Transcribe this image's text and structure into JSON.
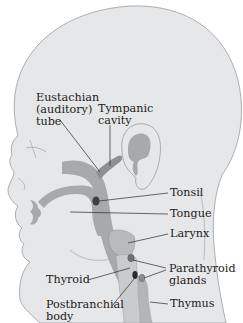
{
  "diagram": {
    "colors": {
      "skin": "#e6e7e8",
      "outline": "#9a9c9e",
      "pharynx": "#a7a9ab",
      "dark_structure": "#4d4d4f",
      "leader_line": "#2a2a2a",
      "text": "#1c1c1c"
    },
    "labels": [
      {
        "id": "eustachian",
        "text": "Eustachian\n(auditory)\ntube"
      },
      {
        "id": "tympanic",
        "text": "Tympanic\ncavity"
      },
      {
        "id": "tonsil",
        "text": "Tonsil"
      },
      {
        "id": "tongue",
        "text": "Tongue"
      },
      {
        "id": "larynx",
        "text": "Larynx"
      },
      {
        "id": "parathyroid",
        "text": "Parathyroid\nglands"
      },
      {
        "id": "thyroid",
        "text": "Thyroid"
      },
      {
        "id": "postbranchial",
        "text": "Postbranchial\nbody"
      },
      {
        "id": "thymus",
        "text": "Thymus"
      }
    ]
  }
}
